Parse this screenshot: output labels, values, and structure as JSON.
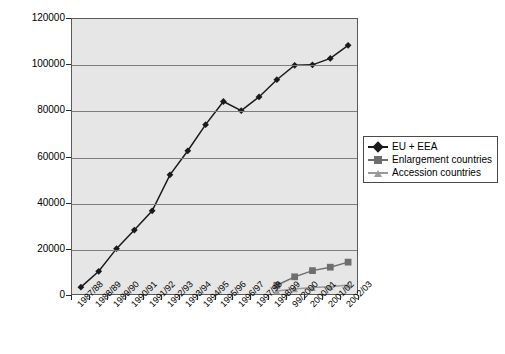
{
  "chart_data": {
    "type": "line",
    "title": "",
    "xlabel": "",
    "ylabel": "Number of students",
    "ylim": [
      0,
      120000
    ],
    "y_ticks": [
      0,
      20000,
      40000,
      60000,
      80000,
      100000,
      120000
    ],
    "y_tick_labels": [
      "0",
      "20000",
      "40000",
      "60000",
      "80000",
      "100000",
      "120000"
    ],
    "grid": true,
    "legend_position": "right",
    "categories": [
      "1987/88",
      "1988/89",
      "1989/90",
      "1990/91",
      "1991/92",
      "1992/93",
      "1993/94",
      "1994/95",
      "1995/96",
      "1996/97",
      "1997/98",
      "1998/99",
      "99/2000",
      "2000/01",
      "2001/02",
      "2002/03"
    ],
    "series": [
      {
        "name": "EU + EEA",
        "color": "#1a1a1a",
        "marker": "diamond",
        "values": [
          3000,
          9900,
          19800,
          27900,
          36300,
          52000,
          62500,
          73900,
          84000,
          80000,
          86000,
          93500,
          99800,
          100000,
          102800,
          108500
        ]
      },
      {
        "name": "Enlargement countries",
        "color": "#6e6e6e",
        "marker": "square",
        "values": [
          null,
          null,
          null,
          null,
          null,
          null,
          null,
          null,
          null,
          null,
          null,
          3800,
          7500,
          10200,
          11700,
          13900
        ]
      },
      {
        "name": "Accession countries",
        "color": "#9a9a9a",
        "marker": "triangle",
        "values": [
          null,
          null,
          null,
          null,
          null,
          null,
          null,
          null,
          null,
          null,
          null,
          1300,
          2200,
          2800,
          3200,
          3900
        ]
      }
    ]
  },
  "axes": {
    "y_title": "Number of students"
  },
  "legend": {
    "items": [
      {
        "label": "EU + EEA"
      },
      {
        "label": "Enlargement countries"
      },
      {
        "label": "Accession countries"
      }
    ]
  },
  "colors": {
    "plot_background": "#e6e6e6",
    "gridline": "#7d7d7d",
    "axis": "#2b2b2b",
    "series_1": "#1a1a1a",
    "series_2": "#6e6e6e",
    "series_3": "#9a9a9a"
  }
}
